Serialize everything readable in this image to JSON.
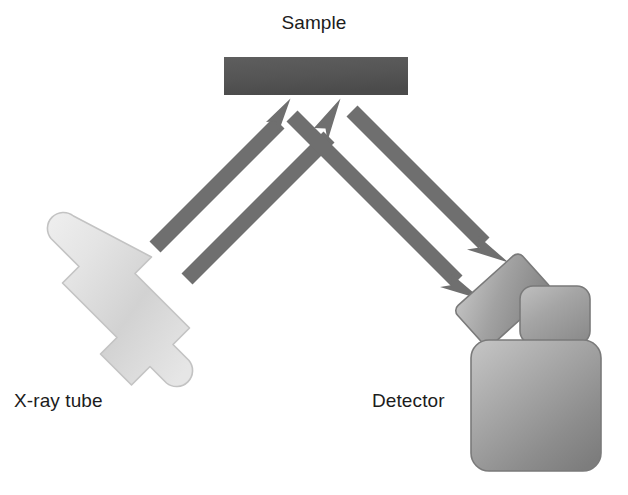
{
  "figure": {
    "kind": "schematic-diagram",
    "background_color": "#ffffff"
  },
  "labels": {
    "sample": "Sample",
    "xray_tube": "X-ray tube",
    "detector": "Detector"
  },
  "colors": {
    "sample_fill_light": "#5a5a5a",
    "sample_fill_dark": "#4a4a4a",
    "beam_gray": "#6f6f6f",
    "tube_light": "#e9e9e9",
    "tube_mid": "#cfcfcf",
    "tube_edge": "#c2c2c2",
    "detector_light": "#b9b9b9",
    "detector_mid": "#9a9a9a",
    "detector_dark": "#7e7e7e",
    "detector_edge": "#7a7a7a",
    "text_color": "#1c1c1c"
  },
  "components": {
    "sample": {
      "name": "Sample",
      "shape": "rectangle",
      "x": 224,
      "y": 57,
      "width": 184,
      "height": 38
    },
    "xray_tube": {
      "name": "X-ray tube",
      "shape": "rotated-stepped-polygon",
      "rotation_deg": 42,
      "center_x": 140,
      "center_y": 315
    },
    "detector": {
      "name": "Detector",
      "parts": [
        {
          "part": "collimator-snout",
          "shape": "rotated-rounded-rect",
          "rotation_deg": -42
        },
        {
          "part": "mid-housing",
          "shape": "rounded-rect",
          "x": 520,
          "y": 286,
          "width": 70,
          "height": 56
        },
        {
          "part": "main-body",
          "shape": "rounded-rect",
          "x": 471,
          "y": 340,
          "width": 130,
          "height": 131
        }
      ]
    }
  },
  "beams": [
    {
      "id": "incident-beam-1",
      "from": "X-ray tube",
      "to": "Sample",
      "direction": "up-right",
      "arrowhead_at": "sample"
    },
    {
      "id": "incident-beam-2",
      "from": "X-ray tube",
      "to": "Sample",
      "direction": "up-right",
      "arrowhead_at": "sample"
    },
    {
      "id": "diffracted-beam-1",
      "from": "Sample",
      "to": "Detector",
      "direction": "down-right",
      "arrowhead_at": "detector"
    },
    {
      "id": "diffracted-beam-2",
      "from": "Sample",
      "to": "Detector",
      "direction": "down-right",
      "arrowhead_at": "detector"
    }
  ]
}
